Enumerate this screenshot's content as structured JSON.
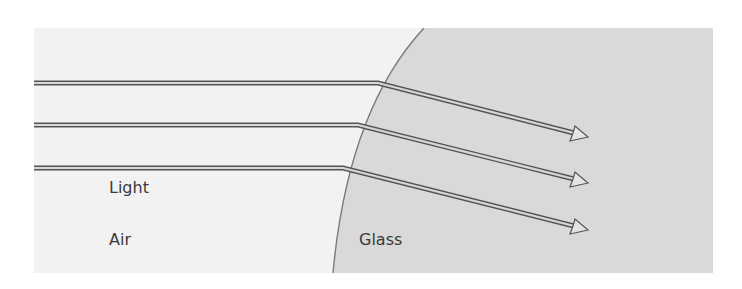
{
  "diagram": {
    "type": "refraction",
    "labels": {
      "light": "Light",
      "air": "Air",
      "glass": "Glass"
    },
    "colors": {
      "air_region": "#f2f2f2",
      "glass_region": "#d9d9d9",
      "boundary": "#7a7a7a",
      "ray_outline": "#555555",
      "ray_fill": "#d8d8d8",
      "text": "#3a3a3a"
    },
    "media": [
      {
        "name": "Air",
        "side": "left"
      },
      {
        "name": "Glass",
        "side": "right"
      }
    ],
    "rays": [
      {
        "id": 1,
        "incident_y": 83,
        "hit_x": 378,
        "end": [
          588,
          137
        ]
      },
      {
        "id": 2,
        "incident_y": 125,
        "hit_x": 358,
        "end": [
          588,
          183
        ]
      },
      {
        "id": 3,
        "incident_y": 168,
        "hit_x": 343,
        "end": [
          588,
          230
        ]
      }
    ]
  }
}
